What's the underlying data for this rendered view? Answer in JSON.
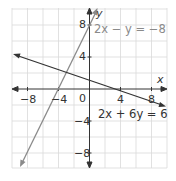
{
  "diagram": {
    "type": "coordinate-graph",
    "x_axis": {
      "label": "x",
      "range": [
        -10,
        10
      ],
      "tick_labels": [
        "-8",
        "-4",
        "0",
        "4",
        "8"
      ]
    },
    "y_axis": {
      "label": "y",
      "range": [
        -10,
        10
      ],
      "tick_labels": [
        "8",
        "4",
        "-4",
        "-8"
      ]
    },
    "grid": {
      "spacing": 2,
      "color": "#d6d6d6"
    },
    "lines": [
      {
        "equation": "2x − y = −8",
        "color": "#8a8a8a",
        "slope": 2,
        "intercept": 8
      },
      {
        "equation": "2x + 6y = 6",
        "color": "#333333",
        "slope": -0.3333,
        "intercept": 1
      }
    ],
    "intersection": {
      "x": -3,
      "y": 2
    }
  },
  "labels": {
    "x": "x",
    "y": "y",
    "origin": "0",
    "x_neg8": "−8",
    "x_neg4": "−4",
    "x_4": "4",
    "x_8": "8",
    "y_8": "8",
    "y_4": "4",
    "y_neg4": "−4",
    "y_neg8": "−8",
    "eq1": "2x − y = −8",
    "eq2": "2x + 6y = 6"
  }
}
